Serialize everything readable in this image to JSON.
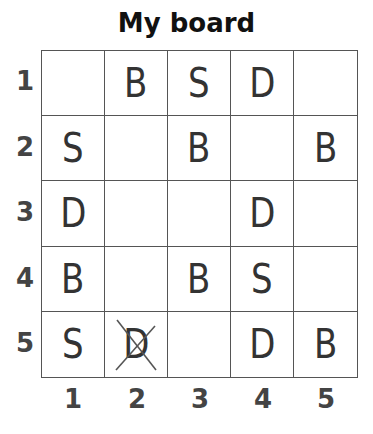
{
  "title": "My board",
  "row_labels": [
    "1",
    "2",
    "3",
    "4",
    "5"
  ],
  "col_labels": [
    "1",
    "2",
    "3",
    "4",
    "5"
  ],
  "rows": [
    [
      "",
      "B",
      "S",
      "D",
      ""
    ],
    [
      "S",
      "",
      "B",
      "",
      "B"
    ],
    [
      "D",
      "",
      "",
      "D",
      ""
    ],
    [
      "B",
      "",
      "B",
      "S",
      ""
    ],
    [
      "S",
      "D",
      "",
      "D",
      "B"
    ]
  ],
  "crossed_out": [
    {
      "row": 5,
      "col": 2,
      "letter": "D"
    }
  ],
  "colors": {
    "grid_line": "#555555",
    "label": "#444444",
    "letter": "#333333"
  }
}
